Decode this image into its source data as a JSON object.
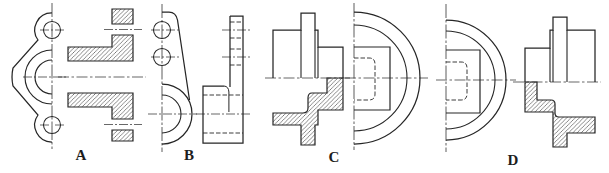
{
  "figure": {
    "background": "#ffffff",
    "line_color": "#262626",
    "options": [
      {
        "label": "A"
      },
      {
        "label": "B"
      },
      {
        "label": "C"
      },
      {
        "label": "D"
      }
    ]
  }
}
